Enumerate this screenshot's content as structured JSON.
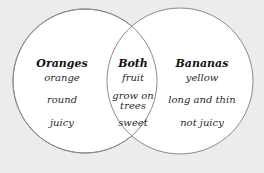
{
  "diagram": {
    "type": "venn",
    "background": "#ececec",
    "circle_fill": "#ffffff",
    "circle_stroke": "#8a8a8a",
    "left": {
      "title": "Oranges",
      "items": [
        "orange",
        "round",
        "juicy"
      ]
    },
    "center": {
      "title": "Both",
      "items": [
        "fruit",
        "grow on",
        "trees",
        "sweet"
      ]
    },
    "right": {
      "title": "Bananas",
      "items": [
        "yellow",
        "long and thin",
        "not juicy"
      ]
    }
  }
}
